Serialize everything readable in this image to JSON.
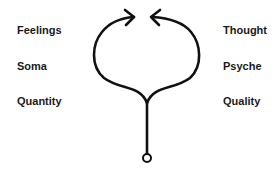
{
  "diagram": {
    "left_labels": [
      "Feelings",
      "Soma",
      "Quantity"
    ],
    "right_labels": [
      "Thought",
      "Psyche",
      "Quality"
    ],
    "stroke_color": "#111111",
    "background": "#ffffff"
  }
}
